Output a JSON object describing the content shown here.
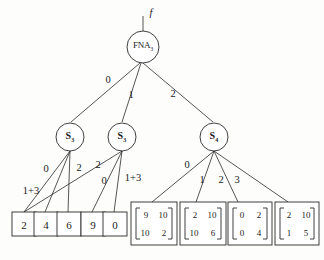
{
  "figure": {
    "type": "tree-diagram",
    "root_function_label": "f"
  },
  "nodes": {
    "root": {
      "base": "FNA",
      "sub": "3",
      "name": "fna-root-node"
    },
    "s_left": {
      "base": "S",
      "sub": "3",
      "name": "s-node-left"
    },
    "s_mid": {
      "base": "S",
      "sub": "3",
      "name": "s-node-middle"
    },
    "s_right": {
      "base": "S",
      "sub": "4",
      "name": "s-node-right"
    }
  },
  "root_edges": [
    {
      "label": "0",
      "target": "s_left"
    },
    {
      "label": "1",
      "target": "s_mid"
    },
    {
      "label": "2",
      "target": "s_right"
    }
  ],
  "s_left_edges": [
    {
      "label": "0"
    },
    {
      "label": "1+3"
    },
    {
      "label": "2"
    }
  ],
  "s_mid_edges": [
    {
      "label": "2"
    },
    {
      "label": "0"
    },
    {
      "label": "1+3"
    }
  ],
  "s_right_edges": [
    {
      "label": "0"
    },
    {
      "label": "1"
    },
    {
      "label": "2"
    },
    {
      "label": "3"
    }
  ],
  "scalar_leaves": [
    {
      "value": "2"
    },
    {
      "value": "4"
    },
    {
      "value": "6"
    },
    {
      "value": "9"
    },
    {
      "value": "0"
    }
  ],
  "matrix_leaves": [
    {
      "r0c0": "9",
      "r0c1": "10",
      "r1c0": "10",
      "r1c1": "2"
    },
    {
      "r0c0": "2",
      "r0c1": "10",
      "r1c0": "10",
      "r1c1": "6"
    },
    {
      "r0c0": "0",
      "r0c1": "2",
      "r1c0": "0",
      "r1c1": "4"
    },
    {
      "r0c0": "2",
      "r0c1": "10",
      "r1c0": "1",
      "r1c1": "5"
    }
  ],
  "colors": {
    "ink": "#2b2b2b",
    "paper": "#fdfdfc"
  }
}
